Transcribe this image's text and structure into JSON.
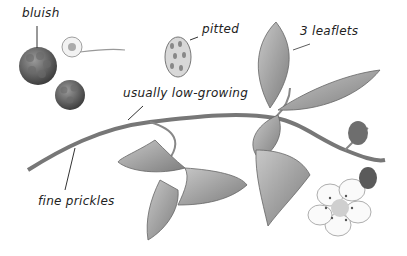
{
  "illustration": {
    "subject": "bramble (dewberry) branch botanical drawing",
    "labels": {
      "bluish": "bluish",
      "pitted": "pitted",
      "leaflets": "3 leaflets",
      "low_growing": "usually low-growing",
      "prickles": "fine prickles"
    },
    "colors": {
      "background": "#ffffff",
      "ink": "#222222",
      "leaf": "#9a9a9a",
      "fruit": "#5a5a5a"
    }
  }
}
